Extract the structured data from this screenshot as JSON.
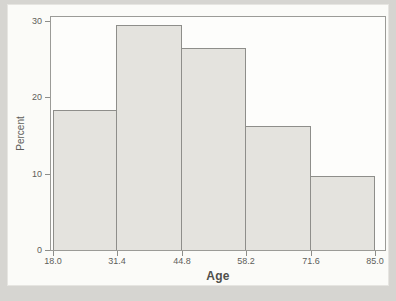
{
  "figure": {
    "kind": "scanned-textbook-histogram"
  },
  "colors": {
    "page_bg": "#d6d5d1",
    "panel_bg": "#fbfbf8",
    "bar_fill": "#e4e3de",
    "bar_border": "#8e8e8a",
    "frame": "#9b9b97",
    "text": "#5e5e5a"
  },
  "chart_data": {
    "type": "bar",
    "variant": "histogram",
    "title": "",
    "xlabel": "Age",
    "ylabel": "Percent",
    "bin_edges": [
      18.0,
      31.4,
      44.8,
      58.2,
      71.6,
      85.0
    ],
    "x_tick_labels": [
      "18.0",
      "31.4",
      "44.8",
      "58.2",
      "71.6",
      "85.0"
    ],
    "values": [
      18.3,
      29.4,
      26.5,
      16.2,
      9.7
    ],
    "y_ticks": [
      0,
      10,
      20,
      30
    ],
    "y_tick_labels": [
      "0",
      "10",
      "20",
      "30"
    ],
    "xlim": [
      17.6,
      87.1
    ],
    "ylim": [
      0,
      30.5
    ],
    "grid": false,
    "legend": "none"
  }
}
